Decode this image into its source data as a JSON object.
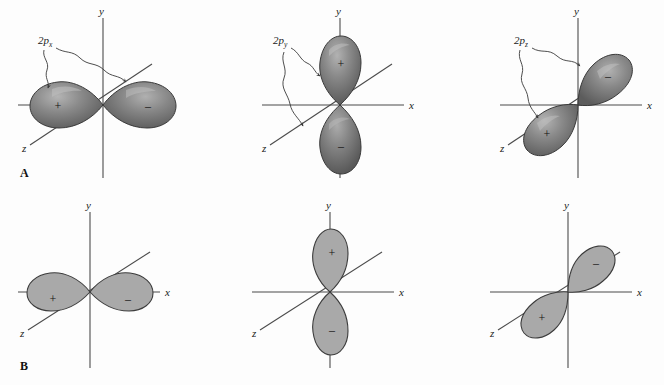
{
  "figure": {
    "background_color": "#fdfdfd",
    "axis_color": "#4b4b4b",
    "lobe_3d_color": "#808080",
    "lobe_flat_color": "#a9a9a9",
    "outline_color": "#3a3a3a"
  },
  "panels": [
    {
      "letter": "A",
      "style": "three-dimensional shaded surfaces",
      "orbitals": [
        {
          "label_main": "2p",
          "label_sub": "x",
          "axis_of_orientation": "x",
          "axis_labels": {
            "x": "x",
            "y": "y",
            "z": "z"
          },
          "lobes": [
            {
              "sign": "+",
              "position": "left along -x"
            },
            {
              "sign": "–",
              "position": "right along +x"
            }
          ],
          "leader_lines": 2
        },
        {
          "label_main": "2p",
          "label_sub": "y",
          "axis_of_orientation": "y",
          "axis_labels": {
            "x": "x",
            "y": "y",
            "z": "z"
          },
          "lobes": [
            {
              "sign": "+",
              "position": "up along +y"
            },
            {
              "sign": "–",
              "position": "down along -y"
            }
          ],
          "leader_lines": 2
        },
        {
          "label_main": "2p",
          "label_sub": "z",
          "axis_of_orientation": "z",
          "axis_labels": {
            "x": "x",
            "y": "y",
            "z": "z"
          },
          "lobes": [
            {
              "sign": "+",
              "position": "lower-left along +z toward viewer"
            },
            {
              "sign": "–",
              "position": "upper-right along -z away from viewer"
            }
          ],
          "leader_lines": 2
        }
      ]
    },
    {
      "letter": "B",
      "style": "flat two-dimensional cross sections",
      "orbitals": [
        {
          "label_main": "",
          "label_sub": "",
          "axis_of_orientation": "x",
          "axis_labels": {
            "x": "x",
            "y": "y",
            "z": "z"
          },
          "lobes": [
            {
              "sign": "+",
              "position": "left along -x"
            },
            {
              "sign": "–",
              "position": "right along +x"
            }
          ],
          "leader_lines": 0
        },
        {
          "label_main": "",
          "label_sub": "",
          "axis_of_orientation": "y",
          "axis_labels": {
            "x": "x",
            "y": "y",
            "z": "z"
          },
          "lobes": [
            {
              "sign": "+",
              "position": "up along +y"
            },
            {
              "sign": "–",
              "position": "down along -y"
            }
          ],
          "leader_lines": 0
        },
        {
          "label_main": "",
          "label_sub": "",
          "axis_of_orientation": "z",
          "axis_labels": {
            "x": "x",
            "y": "y",
            "z": "z"
          },
          "lobes": [
            {
              "sign": "+",
              "position": "lower-left along +z"
            },
            {
              "sign": "–",
              "position": "upper-right along -z"
            }
          ],
          "leader_lines": 0
        }
      ]
    }
  ]
}
